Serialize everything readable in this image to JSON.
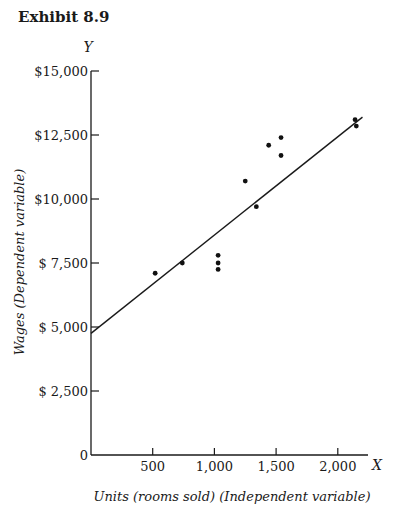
{
  "exhibit_title": "Exhibit 8.9",
  "chart_data": {
    "type": "scatter",
    "title": "Exhibit 8.9",
    "xlabel": "Units (rooms sold) (Independent variable)",
    "ylabel": "Wages (Dependent variable)",
    "x_axis_letter": "X",
    "y_axis_letter": "Y",
    "xlim": [
      0,
      2300
    ],
    "ylim": [
      0,
      15000
    ],
    "x_ticks": [
      500,
      1000,
      1500,
      2000
    ],
    "x_tick_labels": [
      "500",
      "1,000",
      "1,500",
      "2,000"
    ],
    "y_ticks": [
      0,
      2500,
      5000,
      7500,
      10000,
      12500,
      15000
    ],
    "y_tick_labels": [
      "0",
      "$ 2,500",
      "$ 5,000",
      "$ 7,500",
      "$10,000",
      "$12,500",
      "$15,000"
    ],
    "grid": false,
    "series": [
      {
        "name": "Observations",
        "type": "scatter",
        "points": [
          {
            "x": 520,
            "y": 7100
          },
          {
            "x": 740,
            "y": 7500
          },
          {
            "x": 1030,
            "y": 7800
          },
          {
            "x": 1030,
            "y": 7500
          },
          {
            "x": 1030,
            "y": 7250
          },
          {
            "x": 1250,
            "y": 10700
          },
          {
            "x": 1340,
            "y": 9700
          },
          {
            "x": 1440,
            "y": 12100
          },
          {
            "x": 1540,
            "y": 12400
          },
          {
            "x": 1540,
            "y": 11700
          },
          {
            "x": 2140,
            "y": 13100
          },
          {
            "x": 2150,
            "y": 12850
          }
        ]
      },
      {
        "name": "Regression line",
        "type": "line",
        "points": [
          {
            "x": 0,
            "y": 4750
          },
          {
            "x": 2200,
            "y": 13200
          }
        ]
      }
    ]
  }
}
